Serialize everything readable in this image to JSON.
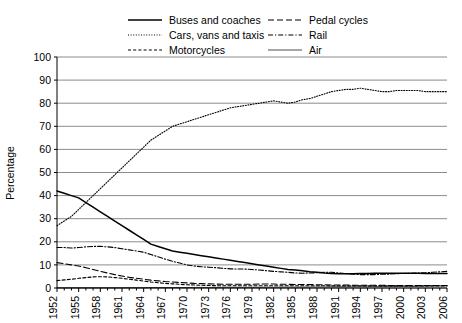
{
  "chart_data": {
    "type": "line",
    "title": "",
    "xlabel": "",
    "ylabel": "Percentage",
    "ylim": [
      0,
      100
    ],
    "ytick_step": 10,
    "yticks": [
      0,
      10,
      20,
      30,
      40,
      50,
      60,
      70,
      80,
      90,
      100
    ],
    "xlim": [
      1952,
      2006
    ],
    "xtick_labels": [
      "1952",
      "1955",
      "1958",
      "1961",
      "1964",
      "1967",
      "1970",
      "1973",
      "1976",
      "1979",
      "1982",
      "1985",
      "1988",
      "1991",
      "1994",
      "1997",
      "2000",
      "2003",
      "2006"
    ],
    "xtick_step": 3,
    "minor_xtick_step": 1,
    "grid": "horizontal",
    "legend_position": "top",
    "x": [
      1952,
      1953,
      1954,
      1955,
      1956,
      1957,
      1958,
      1959,
      1960,
      1961,
      1962,
      1963,
      1964,
      1965,
      1966,
      1967,
      1968,
      1969,
      1970,
      1971,
      1972,
      1973,
      1974,
      1975,
      1976,
      1977,
      1978,
      1979,
      1980,
      1981,
      1982,
      1983,
      1984,
      1985,
      1986,
      1987,
      1988,
      1989,
      1990,
      1991,
      1992,
      1993,
      1994,
      1995,
      1996,
      1997,
      1998,
      1999,
      2000,
      2001,
      2002,
      2003,
      2004,
      2005,
      2006
    ],
    "series": [
      {
        "name": "Buses and coaches",
        "style": "solid",
        "values": [
          42,
          41,
          40,
          39,
          37,
          35,
          33,
          31,
          29,
          27,
          25,
          23,
          21,
          19,
          18,
          17,
          16,
          15.5,
          15,
          14.5,
          14,
          13.5,
          13,
          12.5,
          12,
          11.5,
          11,
          10.5,
          10,
          9.5,
          9,
          8.5,
          8,
          7.8,
          7.5,
          7,
          6.8,
          6.5,
          6.3,
          6.2,
          6.2,
          6.2,
          6.3,
          6.3,
          6.4,
          6.4,
          6.4,
          6.4,
          6.4,
          6.4,
          6.4,
          6.3,
          6.3,
          6.3,
          6.3
        ]
      },
      {
        "name": "Cars, vans and taxis",
        "style": "dotted",
        "values": [
          27,
          29,
          31,
          34,
          37,
          40,
          43,
          46,
          49,
          52,
          55,
          58,
          61,
          64,
          66,
          68,
          70,
          71,
          72,
          73,
          74,
          75,
          76,
          77,
          78,
          78.5,
          79,
          79.5,
          80,
          80.5,
          81,
          80.5,
          80,
          80.5,
          81.5,
          82,
          83,
          84,
          85,
          85.5,
          86,
          86,
          86.5,
          86,
          85.5,
          85,
          85,
          85.5,
          85.5,
          85.5,
          85.5,
          85,
          85,
          85,
          85
        ]
      },
      {
        "name": "Motorcycles",
        "style": "dashed",
        "values": [
          3.2,
          3.5,
          3.8,
          4.2,
          4.5,
          4.8,
          4.9,
          4.8,
          4.5,
          4.2,
          3.8,
          3.4,
          3,
          2.6,
          2.3,
          2,
          1.8,
          1.6,
          1.4,
          1.3,
          1.2,
          1.1,
          1,
          1,
          1,
          1,
          1,
          1,
          1,
          1,
          1,
          1,
          1,
          1,
          1,
          1,
          1,
          1,
          0.9,
          0.9,
          0.9,
          0.9,
          0.9,
          0.9,
          0.9,
          0.9,
          0.9,
          0.9,
          0.9,
          0.9,
          0.9,
          0.9,
          0.9,
          0.9,
          0.9
        ]
      },
      {
        "name": "Pedal cycles",
        "style": "longdash",
        "values": [
          11,
          10.5,
          10,
          9.5,
          8.8,
          8,
          7.2,
          6.5,
          5.8,
          5.2,
          4.6,
          4.2,
          3.8,
          3.4,
          3.1,
          2.8,
          2.6,
          2.4,
          2.2,
          2,
          1.9,
          1.8,
          1.7,
          1.6,
          1.6,
          1.6,
          1.6,
          1.6,
          1.7,
          1.7,
          1.7,
          1.6,
          1.6,
          1.5,
          1.5,
          1.5,
          1.4,
          1.4,
          1.3,
          1.3,
          1.3,
          1.2,
          1.2,
          1.2,
          1.2,
          1.2,
          1.1,
          1.1,
          1.1,
          1.1,
          1.1,
          1.1,
          1.1,
          1.1,
          1.1
        ]
      },
      {
        "name": "Rail",
        "style": "dashdot",
        "values": [
          17.5,
          17.5,
          17.3,
          17.5,
          17.8,
          18,
          18,
          17.8,
          17.5,
          17,
          16.5,
          16,
          15.5,
          14.5,
          13.5,
          12.5,
          11.5,
          10.8,
          10,
          9.5,
          9.2,
          9,
          8.8,
          8.5,
          8.3,
          8.2,
          8.2,
          8,
          7.8,
          7.5,
          7.2,
          7,
          6.8,
          6.5,
          6.4,
          6.5,
          6.6,
          6.8,
          6.8,
          6.5,
          6.2,
          6,
          5.8,
          5.8,
          5.8,
          6,
          6,
          6.2,
          6.3,
          6.4,
          6.5,
          6.6,
          6.8,
          7,
          7.2
        ]
      },
      {
        "name": "Air",
        "style": "thin-solid",
        "values": [
          0.1,
          0.1,
          0.1,
          0.1,
          0.1,
          0.1,
          0.1,
          0.1,
          0.1,
          0.1,
          0.15,
          0.15,
          0.15,
          0.2,
          0.2,
          0.2,
          0.2,
          0.2,
          0.2,
          0.25,
          0.25,
          0.25,
          0.25,
          0.3,
          0.3,
          0.3,
          0.3,
          0.3,
          0.3,
          0.35,
          0.35,
          0.35,
          0.4,
          0.4,
          0.4,
          0.4,
          0.45,
          0.45,
          0.5,
          0.5,
          0.5,
          0.5,
          0.55,
          0.55,
          0.6,
          0.6,
          0.6,
          0.65,
          0.7,
          0.7,
          0.75,
          0.8,
          0.85,
          0.9,
          0.95
        ]
      }
    ],
    "legend": [
      {
        "label": "Buses and coaches",
        "style": "solid"
      },
      {
        "label": "Pedal cycles",
        "style": "longdash"
      },
      {
        "label": "Cars, vans and taxis",
        "style": "dotted"
      },
      {
        "label": "Rail",
        "style": "dashdot"
      },
      {
        "label": "Motorcycles",
        "style": "dashed"
      },
      {
        "label": "Air",
        "style": "thin-solid"
      }
    ],
    "colors": {
      "line": "#000000",
      "grid": "#8c8c8c",
      "axis": "#000000",
      "background": "#ffffff"
    }
  }
}
